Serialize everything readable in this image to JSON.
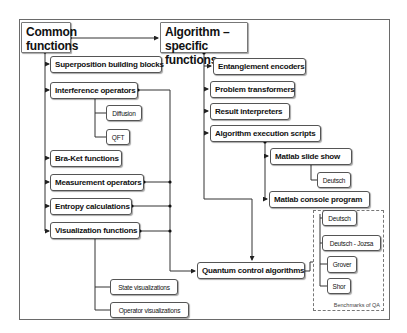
{
  "diagram": {
    "common": {
      "title": "Common functions",
      "children": [
        "Superposition building blocks",
        "Interference operators",
        "Bra-Ket functions",
        "Measurement operators",
        "Entropy calculations",
        "Visualization functions"
      ],
      "interference_children": [
        "Diffusion",
        "QFT"
      ],
      "visualization_children": [
        "State visualizations",
        "Operator visualizations"
      ]
    },
    "algorithm": {
      "title": "Algorithm – specific functions",
      "children": [
        "Entanglement encoders",
        "Problem transformers",
        "Result interpreters",
        "Algorithm execution scripts"
      ],
      "script_children": [
        "Matlab slide show",
        "Matlab console program"
      ],
      "slideshow_children": [
        "Deutsch"
      ]
    },
    "qca": {
      "title": "Quantum control algorithms",
      "benchmarks": [
        "Deutsch",
        "Deutsch - Jozsa",
        "Grover",
        "Shor"
      ],
      "benchmarks_caption": "Benchmarks of QA"
    }
  }
}
